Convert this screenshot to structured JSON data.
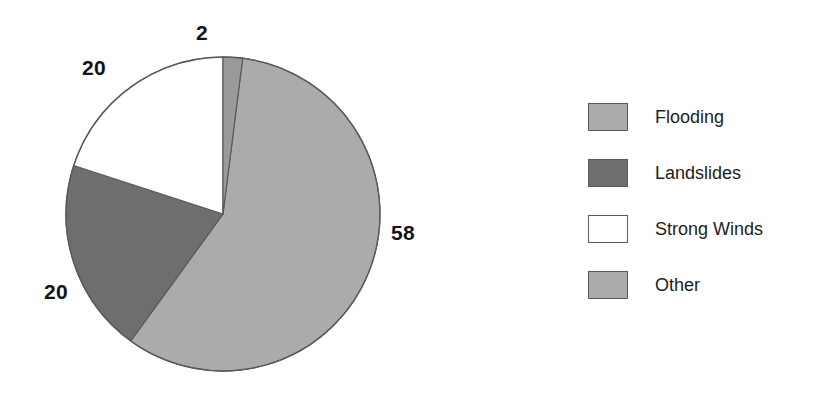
{
  "chart_data": {
    "type": "pie",
    "title": "",
    "categories": [
      "Flooding",
      "Landslides",
      "Strong Winds",
      "Other"
    ],
    "values": [
      58,
      20,
      20,
      2
    ],
    "value_labels": [
      "58",
      "20",
      "20",
      "2"
    ],
    "unit": "percent",
    "total": 100,
    "start_angle_deg": 0,
    "direction": "clockwise",
    "legend_position": "right",
    "grid": false,
    "colors": [
      "#ABABAB",
      "#6E6E6E",
      "#FFFFFF",
      "#9A9A9A"
    ],
    "outline_color": "#5A5A5A",
    "slices": [
      {
        "label": "Flooding",
        "value": 58,
        "value_label": "58",
        "color": "#ABABAB",
        "start_deg": 7.2,
        "end_deg": 216.0
      },
      {
        "label": "Landslides",
        "value": 20,
        "value_label": "20",
        "color": "#6E6E6E",
        "start_deg": 216.0,
        "end_deg": 288.0
      },
      {
        "label": "Strong Winds",
        "value": 20,
        "value_label": "20",
        "color": "#FFFFFF",
        "start_deg": 288.0,
        "end_deg": 360.0
      },
      {
        "label": "Other",
        "value": 2,
        "value_label": "2",
        "color": "#9A9A9A",
        "start_deg": 0.0,
        "end_deg": 7.2
      }
    ]
  },
  "pie": {
    "center_x": 223,
    "center_y": 214,
    "radius": 157,
    "labels": {
      "flooding": "58",
      "landslides": "20",
      "strong_winds": "20",
      "other": "2"
    }
  },
  "legend": {
    "items": [
      {
        "label": "Flooding",
        "color": "#ABABAB"
      },
      {
        "label": "Landslides",
        "color": "#6E6E6E"
      },
      {
        "label": "Strong Winds",
        "color": "#FFFFFF"
      },
      {
        "label": "Other",
        "color": "#ABABAB"
      }
    ]
  }
}
